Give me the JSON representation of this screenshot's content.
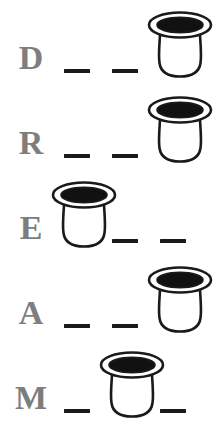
{
  "worksheet": {
    "title": "DREAM letter-position worksheet",
    "background_color": "#ffffff",
    "letter_color": "#7e7e7e",
    "dash_color": "#1a1a1a",
    "icon_outline_color": "#1a1a1a",
    "icon_fill_color": "#ffffff",
    "icon_rim_color": "#111111",
    "icon_name": "cup-icon",
    "rows": [
      {
        "letter": "D",
        "slots": [
          "dash",
          "dash",
          "cup"
        ]
      },
      {
        "letter": "R",
        "slots": [
          "dash",
          "dash",
          "cup"
        ]
      },
      {
        "letter": "E",
        "slots": [
          "cup",
          "dash",
          "dash"
        ]
      },
      {
        "letter": "A",
        "slots": [
          "dash",
          "dash",
          "cup"
        ]
      },
      {
        "letter": "M",
        "slots": [
          "dash",
          "cup",
          "dash"
        ]
      }
    ]
  }
}
